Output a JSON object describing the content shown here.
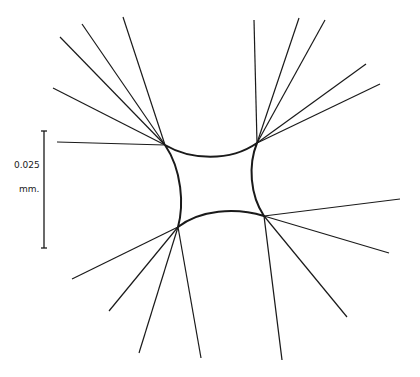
{
  "figure": {
    "stroke_color": "#1a1a1a",
    "background_color": "#ffffff"
  },
  "scale_bar": {
    "value_label": "0.025",
    "unit_label": "mm.",
    "x": 44,
    "y_top": 131,
    "y_bottom": 248
  },
  "body_outline": {
    "corners": {
      "top_left": [
        165,
        145
      ],
      "top_right": [
        257,
        143
      ],
      "bottom_right": [
        264,
        216
      ],
      "bottom_left": [
        178,
        227
      ]
    }
  },
  "filaments": {
    "top_left": [
      [
        57,
        142
      ],
      [
        53,
        88
      ],
      [
        60,
        37
      ],
      [
        82,
        24
      ],
      [
        123,
        17
      ]
    ],
    "top_right": [
      [
        254,
        20
      ],
      [
        299,
        18
      ],
      [
        325,
        20
      ],
      [
        366,
        64
      ],
      [
        380,
        84
      ]
    ],
    "bottom_left": [
      [
        72,
        279
      ],
      [
        109,
        311
      ],
      [
        139,
        353
      ],
      [
        201,
        358
      ]
    ],
    "bottom_right": [
      [
        400,
        199
      ],
      [
        389,
        253
      ],
      [
        347,
        317
      ],
      [
        282,
        360
      ]
    ]
  }
}
